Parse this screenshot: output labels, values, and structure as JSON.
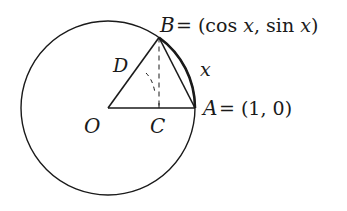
{
  "diagram": {
    "type": "unit-circle-geometry",
    "points": {
      "O": {
        "label": "O"
      },
      "A": {
        "label": "A",
        "coord_text": "= (1, 0)"
      },
      "B": {
        "label": "B",
        "coord_text": "= (cos ",
        "var": "x",
        "mid": ", sin ",
        "var2": "x",
        "close": ")"
      },
      "C": {
        "label": "C"
      },
      "D": {
        "label": "D"
      }
    },
    "arc_label": "x",
    "colors": {
      "stroke": "#1a1a1a",
      "background": "#ffffff"
    }
  }
}
